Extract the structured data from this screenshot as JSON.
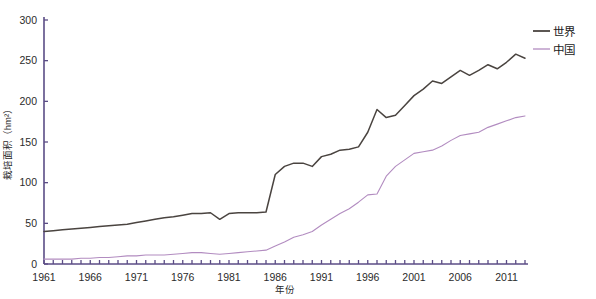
{
  "chart_data": {
    "type": "line",
    "title": "",
    "xlabel": "年份",
    "ylabel": "栽培面积（hm²）",
    "xlim": [
      1961,
      2013
    ],
    "ylim": [
      0,
      300
    ],
    "grid": false,
    "legend_position": "right",
    "x_tick_labels": [
      "1961",
      "1966",
      "1971",
      "1976",
      "1981",
      "1986",
      "1991",
      "1996",
      "2001",
      "2006",
      "2011"
    ],
    "x_tick_values": [
      1961,
      1966,
      1971,
      1976,
      1981,
      1986,
      1991,
      1996,
      2001,
      2006,
      2011
    ],
    "y_tick_labels": [
      "0",
      "50",
      "100",
      "150",
      "200",
      "250",
      "300"
    ],
    "y_tick_values": [
      0,
      50,
      100,
      150,
      200,
      250,
      300
    ],
    "x": [
      1961,
      1962,
      1963,
      1964,
      1965,
      1966,
      1967,
      1968,
      1969,
      1970,
      1971,
      1972,
      1973,
      1974,
      1975,
      1976,
      1977,
      1978,
      1979,
      1980,
      1981,
      1982,
      1983,
      1984,
      1985,
      1986,
      1987,
      1988,
      1989,
      1990,
      1991,
      1992,
      1993,
      1994,
      1995,
      1996,
      1997,
      1998,
      1999,
      2000,
      2001,
      2002,
      2003,
      2004,
      2005,
      2006,
      2007,
      2008,
      2009,
      2010,
      2011,
      2012,
      2013
    ],
    "series": [
      {
        "name": "世界",
        "color": "#4a4440",
        "values": [
          40,
          41,
          42,
          43,
          44,
          45,
          46,
          47,
          48,
          49,
          51,
          53,
          55,
          57,
          58,
          60,
          62,
          62,
          63,
          55,
          62,
          63,
          63,
          63,
          64,
          110,
          120,
          124,
          124,
          120,
          132,
          135,
          140,
          141,
          144,
          162,
          190,
          180,
          183,
          195,
          207,
          215,
          225,
          222,
          230,
          238,
          232,
          238,
          245,
          240,
          248,
          258,
          253
        ]
      },
      {
        "name": "中国",
        "color": "#b28cc0",
        "values": [
          6,
          6,
          6,
          6,
          7,
          7,
          8,
          8,
          9,
          10,
          10,
          11,
          11,
          11,
          12,
          13,
          14,
          14,
          13,
          12,
          13,
          14,
          15,
          16,
          17,
          22,
          27,
          33,
          36,
          40,
          48,
          55,
          62,
          68,
          76,
          85,
          86,
          108,
          120,
          128,
          136,
          138,
          140,
          145,
          152,
          158,
          160,
          162,
          168,
          172,
          176,
          180,
          182
        ]
      }
    ]
  },
  "legend": {
    "items": [
      {
        "label": "世界",
        "color": "#4a4440"
      },
      {
        "label": "中国",
        "color": "#b28cc0"
      }
    ]
  },
  "axes": {
    "y_axis_label": "栽培面积（hm²）",
    "x_axis_label": "年份"
  }
}
